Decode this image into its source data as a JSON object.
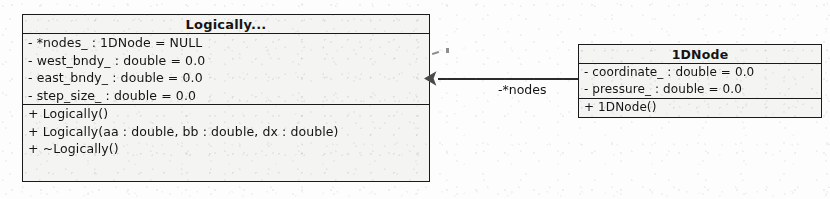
{
  "diagram": {
    "type": "uml-class-diagram",
    "classes": [
      {
        "name": "Logically...",
        "attributes": [
          "- *nodes_ : 1DNode = NULL",
          "- west_bndy_ : double = 0.0",
          "- east_bndy_ : double = 0.0",
          "- step_size_ : double = 0.0"
        ],
        "operations": [
          "+ Logically()",
          "+ Logically(aa : double, bb : double, dx : double)",
          "+ ~Logically()"
        ]
      },
      {
        "name": "1DNode",
        "attributes": [
          "- coordinate_ : double = 0.0",
          "- pressure_ : double = 0.0"
        ],
        "operations": [
          "+ 1DNode()"
        ]
      }
    ],
    "association": {
      "label": "-*nodes",
      "arrow": "filled-arrowhead"
    }
  }
}
